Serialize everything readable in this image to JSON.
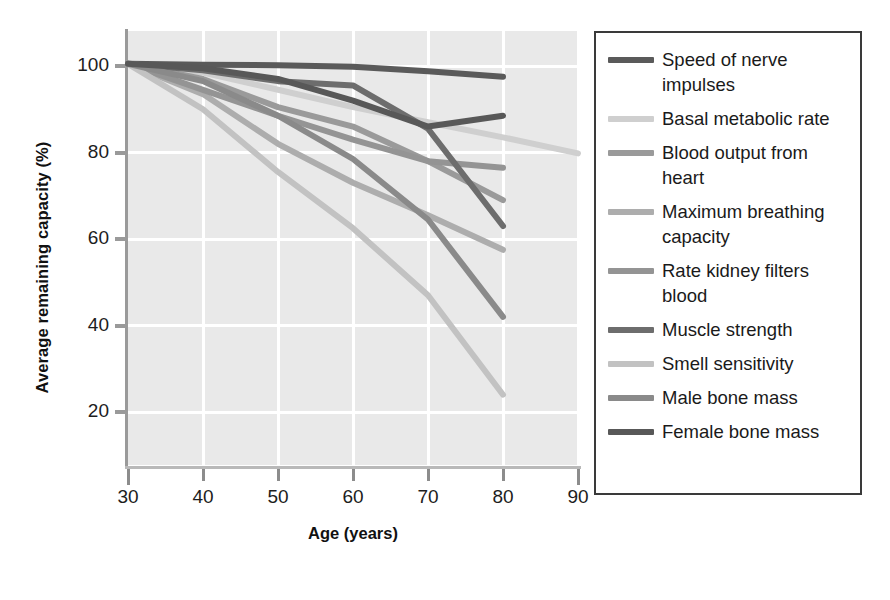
{
  "chart_data": {
    "type": "line",
    "title": "",
    "xlabel": "Age (years)",
    "ylabel": "Average remaining capacity (%)",
    "xlim": [
      30,
      90
    ],
    "ylim": [
      10,
      104
    ],
    "xticks": [
      30,
      40,
      50,
      60,
      70,
      80,
      90
    ],
    "yticks": [
      20,
      40,
      60,
      80,
      100
    ],
    "grid": true,
    "legend_position": "right-outside",
    "x": [
      30,
      40,
      50,
      60,
      70,
      80
    ],
    "series": [
      {
        "name": "Speed of nerve impulses",
        "color": "#5a5a5a",
        "x": [
          30,
          40,
          50,
          60,
          70,
          80
        ],
        "values": [
          100.5,
          100.3,
          100.2,
          99.8,
          98.8,
          97.5
        ]
      },
      {
        "name": "Basal metabolic rate",
        "color": "#cfcfcf",
        "x": [
          30,
          40,
          50,
          60,
          70,
          80,
          90
        ],
        "values": [
          100.5,
          98.5,
          94.5,
          90.5,
          87.0,
          83.5,
          79.8
        ]
      },
      {
        "name": "Blood output from heart",
        "color": "#9a9a9a",
        "x": [
          30,
          40,
          50,
          60,
          70,
          80
        ],
        "values": [
          100.5,
          97.0,
          90.5,
          86.0,
          78.0,
          69.0
        ]
      },
      {
        "name": "Maximum breathing capacity",
        "color": "#adadad",
        "x": [
          30,
          40,
          50,
          60,
          70,
          80
        ],
        "values": [
          100.5,
          93.5,
          82.0,
          73.0,
          65.5,
          57.5
        ]
      },
      {
        "name": "Rate kidney filters blood",
        "color": "#949494",
        "x": [
          30,
          40,
          50,
          60,
          70,
          80
        ],
        "values": [
          100.5,
          94.5,
          88.5,
          83.0,
          78.0,
          76.5
        ]
      },
      {
        "name": "Muscle strength",
        "color": "#6d6d6d",
        "x": [
          30,
          40,
          50,
          60,
          70,
          80
        ],
        "values": [
          100.5,
          99.0,
          96.5,
          95.5,
          85.5,
          63.0
        ]
      },
      {
        "name": "Smell sensitivity",
        "color": "#c2c2c2",
        "x": [
          30,
          40,
          50,
          60,
          70,
          80
        ],
        "values": [
          100.5,
          90.0,
          75.5,
          62.5,
          47.0,
          24.0
        ]
      },
      {
        "name": "Male bone mass",
        "color": "#8a8a8a",
        "x": [
          30,
          40,
          50,
          60,
          70,
          80
        ],
        "values": [
          100.5,
          96.5,
          88.5,
          78.5,
          64.5,
          42.0
        ]
      },
      {
        "name": "Female bone mass",
        "color": "#585858",
        "x": [
          30,
          40,
          50,
          60,
          70,
          80
        ],
        "values": [
          100.5,
          99.5,
          97.0,
          92.0,
          86.0,
          88.5
        ]
      }
    ]
  },
  "axes": {
    "ylabel": "Average remaining capacity (%)",
    "xlabel": "Age (years)",
    "ytick_labels": [
      "100",
      "80",
      "60",
      "40",
      "20"
    ],
    "xtick_labels": [
      "30",
      "40",
      "50",
      "60",
      "70",
      "80",
      "90"
    ]
  },
  "legend": {
    "items": [
      {
        "label": "Speed of nerve impulses",
        "color": "#5a5a5a"
      },
      {
        "label": "Basal metabolic rate",
        "color": "#cfcfcf"
      },
      {
        "label": "Blood output from heart",
        "color": "#9a9a9a"
      },
      {
        "label": "Maximum breathing capacity",
        "color": "#adadad"
      },
      {
        "label": "Rate kidney filters blood",
        "color": "#949494"
      },
      {
        "label": "Muscle strength",
        "color": "#6d6d6d"
      },
      {
        "label": "Smell sensitivity",
        "color": "#c2c2c2"
      },
      {
        "label": "Male bone mass",
        "color": "#8a8a8a"
      },
      {
        "label": "Female bone mass",
        "color": "#585858"
      }
    ]
  },
  "colors": {
    "plot_background": "#e9e9e9",
    "gridline": "#ffffff",
    "axis": "#9a9a9a",
    "legend_border": "#3a3a3a",
    "text": "#1a1a1a"
  }
}
